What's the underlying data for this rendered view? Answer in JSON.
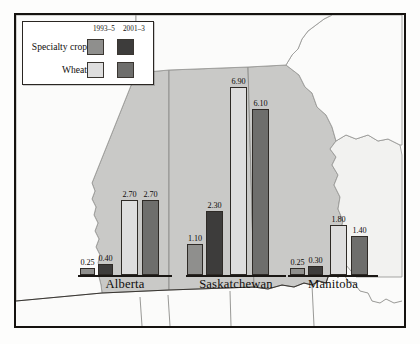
{
  "figure": {
    "region_name": "Canadian Prairie Provinces",
    "background_color": "#fbfbfa",
    "frame_color": "#15120f",
    "province_fill": "#c9c9c7",
    "neighbour_fill": "#f4f4f2",
    "border_line_color": "#8d8d8a"
  },
  "legend": {
    "period_1_label": "1993–5",
    "period_2_label": "2001–3",
    "rows": [
      {
        "label": "Specialty crop",
        "swatch_1_color": "#8f8f8d",
        "swatch_2_color": "#3d3c3b"
      },
      {
        "label": "Wheat",
        "swatch_1_color": "#dedede",
        "swatch_2_color": "#6e6e6c"
      }
    ]
  },
  "chart_data": {
    "type": "bar",
    "xlabel": "",
    "ylabel": "",
    "ylim": [
      0,
      6.9
    ],
    "grid": false,
    "legend_position": "top-left",
    "categories": [
      "Alberta",
      "Saskatchewan",
      "Manitoba"
    ],
    "series": [
      {
        "name": "Specialty crop 1993–5",
        "color": "#8f8f8d",
        "values": [
          0.25,
          1.1,
          0.25
        ],
        "labels": [
          "0.25",
          "1.10",
          "0.25"
        ]
      },
      {
        "name": "Specialty crop 2001–3",
        "color": "#3d3c3b",
        "values": [
          0.4,
          2.3,
          0.3
        ],
        "labels": [
          "0.40",
          "2.30",
          "0.30"
        ]
      },
      {
        "name": "Wheat 1993–5",
        "color": "#dedede",
        "values": [
          2.7,
          6.9,
          1.8
        ],
        "labels": [
          "2.70",
          "6.90",
          "1.80"
        ]
      },
      {
        "name": "Wheat 2001–3",
        "color": "#6e6e6c",
        "values": [
          2.7,
          6.1,
          1.4
        ],
        "labels": [
          "2.70",
          "6.10",
          "1.40"
        ]
      }
    ]
  },
  "groups": [
    {
      "province": "Alberta",
      "left": 62,
      "baseline_top": 260,
      "width": 94,
      "bars": [
        {
          "label": "0.25",
          "value": 0.25,
          "color": "#8f8f8d",
          "x": 2,
          "w": 15,
          "h": 7
        },
        {
          "label": "0.40",
          "value": 0.4,
          "color": "#3d3c3b",
          "x": 20,
          "w": 15,
          "h": 11
        },
        {
          "label": "2.70",
          "value": 2.7,
          "color": "#dedede",
          "x": 43,
          "w": 17,
          "h": 75
        },
        {
          "label": "2.70",
          "value": 2.7,
          "color": "#6e6e6c",
          "x": 64,
          "w": 17,
          "h": 75
        }
      ]
    },
    {
      "province": "Saskatchewan",
      "left": 170,
      "baseline_top": 260,
      "width": 100,
      "bars": [
        {
          "label": "1.10",
          "value": 1.1,
          "color": "#8f8f8d",
          "x": 1,
          "w": 16,
          "h": 31
        },
        {
          "label": "2.30",
          "value": 2.3,
          "color": "#3d3c3b",
          "x": 20,
          "w": 17,
          "h": 64
        },
        {
          "label": "6.90",
          "value": 6.9,
          "color": "#dedede",
          "x": 44,
          "w": 17,
          "h": 188
        },
        {
          "label": "6.10",
          "value": 6.1,
          "color": "#6e6e6c",
          "x": 66,
          "w": 17,
          "h": 166
        }
      ]
    },
    {
      "province": "Manitoba",
      "left": 272,
      "baseline_top": 260,
      "width": 90,
      "bars": [
        {
          "label": "0.25",
          "value": 0.25,
          "color": "#8f8f8d",
          "x": 2,
          "w": 15,
          "h": 7
        },
        {
          "label": "0.30",
          "value": 0.3,
          "color": "#3d3c3b",
          "x": 20,
          "w": 15,
          "h": 9
        },
        {
          "label": "1.80",
          "value": 1.8,
          "color": "#dedede",
          "x": 42,
          "w": 17,
          "h": 50
        },
        {
          "label": "1.40",
          "value": 1.4,
          "color": "#6e6e6c",
          "x": 63,
          "w": 17,
          "h": 39
        }
      ]
    }
  ],
  "province_labels": [
    {
      "name": "Alberta",
      "left": 62,
      "top": 262,
      "width": 94
    },
    {
      "name": "Saskatchewan",
      "left": 163,
      "top": 262,
      "width": 114
    },
    {
      "name": "Manitoba",
      "left": 272,
      "top": 262,
      "width": 90
    }
  ]
}
